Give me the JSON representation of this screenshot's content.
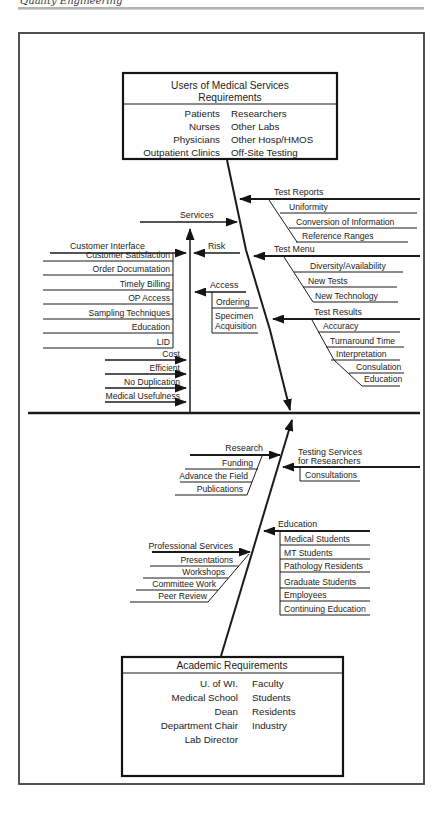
{
  "page": {
    "running_header_clipped": "Quality Engineering"
  },
  "top_box": {
    "title_line1": "Users of Medical Services",
    "title_line2": "Requirements",
    "left": [
      "Patients",
      "Nurses",
      "Physicians",
      "Outpatient Clinics"
    ],
    "right": [
      "Researchers",
      "Other Labs",
      "Other Hosp/HMOS",
      "Off-Site Testing"
    ]
  },
  "top_left": {
    "services": "Services",
    "customer_interface": "Customer Interface",
    "ci_items": [
      "Customer Satisfaction",
      "Order Documatation",
      "Timely Billing",
      "OP Access",
      "Sampling Techniques",
      "Education",
      "LID"
    ],
    "risk": "Risk",
    "access": "Access",
    "access_item1": "Ordering",
    "access_item2_line1": "Specimen",
    "access_item2_line2": "Acquisition",
    "cost_items": [
      "Cost",
      "Efficient",
      "No Duplication",
      "Medical Usefulness"
    ]
  },
  "top_right": {
    "test_reports": "Test Reports",
    "test_reports_items": [
      "Uniformity",
      "Conversion of Information",
      "Reference Ranges"
    ],
    "test_menu": "Test Menu",
    "test_menu_items": [
      "Diversity/Availability",
      "New Tests",
      "New Technology"
    ],
    "test_results": "Test Results",
    "test_results_items": [
      "Accuracy",
      "Turnaround Time",
      "Interpretation",
      "Consulation",
      "Education"
    ]
  },
  "bottom_left": {
    "research": "Research",
    "research_items": [
      "Funding",
      "Advance the Field",
      "Publications"
    ],
    "professional_services": "Professional Services",
    "ps_items": [
      "Presentations",
      "Workshops",
      "Committee Work",
      "Peer Review"
    ]
  },
  "bottom_right": {
    "testing_services_line1": "Testing Services",
    "testing_services_line2": "for Researchers",
    "testing_services_item1": "Consultations",
    "education": "Education",
    "education_items": [
      "Medical Students",
      "MT Students",
      "Pathology Residents",
      "Graduate Students",
      "Employees",
      "Continuing Education"
    ]
  },
  "bottom_box": {
    "title": "Academic Requirements",
    "left": [
      "U. of WI.",
      "Medical School",
      "Dean",
      "Department Chair",
      "Lab Director"
    ],
    "right": [
      "Faculty",
      "Students",
      "Residents",
      "Industry"
    ]
  }
}
